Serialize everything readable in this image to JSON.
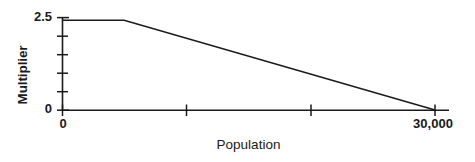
{
  "chart_data": {
    "type": "line",
    "title": "",
    "subtitle": "",
    "xlabel": "Population",
    "ylabel": "Multiplier",
    "xlim": [
      0,
      30000
    ],
    "ylim": [
      0,
      2.5
    ],
    "grid": false,
    "legend": null,
    "background_color": "#ffffff",
    "line_color": "#1a1a1a",
    "axis_color": "#1a1a1a",
    "x_tick_labels": [
      "0",
      "30,000"
    ],
    "y_tick_labels": [
      "0",
      "2.5"
    ],
    "x_tick_values": [
      0,
      10000,
      20000,
      30000
    ],
    "y_tick_values": [
      0,
      0.5,
      1.0,
      1.5,
      2.0,
      2.5
    ],
    "annotations": [],
    "series": [
      {
        "name": "Multiplier vs Population",
        "x": [
          0,
          5000,
          30000
        ],
        "y": [
          2.45,
          2.45,
          0
        ]
      }
    ],
    "description_points": [
      {
        "population": 0,
        "multiplier": 2.45
      },
      {
        "population": 5000,
        "multiplier": 2.45
      },
      {
        "population": 30000,
        "multiplier": 0
      }
    ]
  },
  "axes": {
    "y_title": "Multiplier",
    "x_title": "Population",
    "y_label_max": "2.5",
    "y_label_min": "0",
    "x_label_min": "0",
    "x_label_max": "30,000"
  }
}
